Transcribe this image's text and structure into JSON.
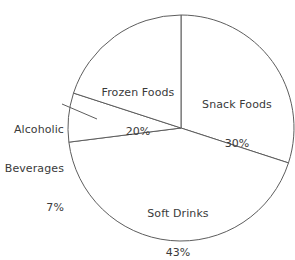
{
  "chart_data": {
    "type": "pie",
    "title": "",
    "categories": [
      "Snack Foods",
      "Soft Drinks",
      "Alcoholic Beverages",
      "Frozen Foods"
    ],
    "values": [
      30,
      43,
      7,
      20
    ],
    "unit": "%",
    "legend": "none",
    "labels_inside": true,
    "slices": [
      {
        "name": "Snack Foods",
        "value": 30,
        "value_label": "30%",
        "start_angle_deg": 0,
        "end_angle_deg": 108,
        "color": "#ffffff",
        "stroke": "#5d5d5d",
        "label_placement": "inside"
      },
      {
        "name": "Soft Drinks",
        "value": 43,
        "value_label": "43%",
        "start_angle_deg": 108,
        "end_angle_deg": 262.8,
        "color": "#ffffff",
        "stroke": "#5d5d5d",
        "label_placement": "inside"
      },
      {
        "name": "Alcoholic Beverages",
        "value": 7,
        "value_label": "7%",
        "start_angle_deg": 262.8,
        "end_angle_deg": 288,
        "color": "#ffffff",
        "stroke": "#5d5d5d",
        "label_placement": "outside-left-leader"
      },
      {
        "name": "Frozen Foods",
        "value": 20,
        "value_label": "20%",
        "start_angle_deg": 288,
        "end_angle_deg": 360,
        "color": "#ffffff",
        "stroke": "#5d5d5d",
        "label_placement": "inside"
      }
    ]
  },
  "labels": {
    "frozen_foods": {
      "name": "Frozen Foods",
      "value": "20%"
    },
    "snack_foods": {
      "name": "Snack Foods",
      "value": "30%"
    },
    "soft_drinks": {
      "name": "Soft Drinks",
      "value": "43%"
    },
    "alcoholic_beverages": {
      "name_line1": "Alcoholic",
      "name_line2": "Beverages",
      "value": "7%"
    }
  },
  "geometry": {
    "center_x": 181,
    "center_y": 128,
    "radius": 113,
    "canvas_width": 295,
    "canvas_height": 244
  },
  "colors": {
    "background": "#ffffff",
    "slice_fill": "#ffffff",
    "stroke": "#5d5d5d",
    "text": "#3a3a3a"
  }
}
